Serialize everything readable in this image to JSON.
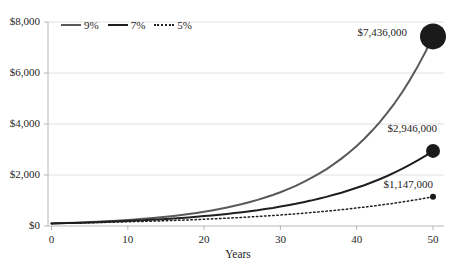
{
  "chart_data": {
    "type": "line",
    "title": "",
    "xlabel": "Years",
    "ylabel": "",
    "x_range": [
      0,
      50
    ],
    "ylim": [
      0,
      8000
    ],
    "y_axis_units": "thousands of dollars",
    "grid": "horizontal",
    "legend_position": "top-left",
    "gridline_color": "#e0e0e0",
    "axis_color": "#b7b7b7",
    "text_color": "#262626",
    "x_ticks": [
      {
        "value": 0,
        "label": "0"
      },
      {
        "value": 10,
        "label": "10"
      },
      {
        "value": 20,
        "label": "20"
      },
      {
        "value": 30,
        "label": "30"
      },
      {
        "value": 40,
        "label": "40"
      },
      {
        "value": 50,
        "label": "50"
      }
    ],
    "y_ticks": [
      {
        "value": 0,
        "label": "$0"
      },
      {
        "value": 2000,
        "label": "$2,000"
      },
      {
        "value": 4000,
        "label": "$4,000"
      },
      {
        "value": 6000,
        "label": "$6,000"
      },
      {
        "value": 8000,
        "label": "$8,000"
      }
    ],
    "series": [
      {
        "name": "9%",
        "color": "#595959",
        "style": "solid",
        "width": 2,
        "marker_color": "#1a1a1a",
        "marker_radius": 13,
        "end_label": "$7,436,000",
        "x": [
          0,
          10,
          20,
          30,
          40,
          50
        ],
        "values": [
          100,
          237,
          560,
          1327,
          3141,
          7436
        ]
      },
      {
        "name": "7%",
        "color": "#1f1f1f",
        "style": "solid",
        "width": 2,
        "marker_color": "#1a1a1a",
        "marker_radius": 7,
        "end_label": "$2,946,000",
        "x": [
          0,
          10,
          20,
          30,
          40,
          50
        ],
        "values": [
          100,
          197,
          387,
          761,
          1497,
          2946
        ]
      },
      {
        "name": "5%",
        "color": "#1f1f1f",
        "style": "dotted",
        "width": 1.5,
        "marker_color": "#1a1a1a",
        "marker_radius": 3,
        "end_label": "$1,147,000",
        "x": [
          0,
          10,
          20,
          30,
          40,
          50
        ],
        "values": [
          100,
          163,
          265,
          432,
          704,
          1147
        ]
      }
    ]
  }
}
